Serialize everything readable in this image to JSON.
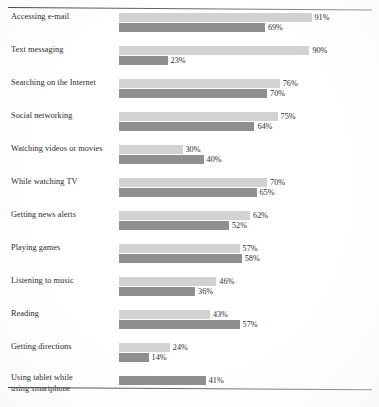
{
  "figure": {
    "top_rule": "horizontal-rule",
    "bottom_rule": "horizontal-rule",
    "footnote": ""
  },
  "chart_data": {
    "type": "bar",
    "orientation": "horizontal",
    "grouped": true,
    "title": "",
    "subtitle": "",
    "xlabel": "",
    "ylabel": "",
    "xlim": [
      0,
      100
    ],
    "grid": false,
    "legend_position": "none",
    "value_suffix": "%",
    "colors": {
      "series_1": "#d2d2d2",
      "series_2": "#8f8f8f",
      "text": "#2b2b2b",
      "rule": "#4a4a4a",
      "background": "#ffffff"
    },
    "categories": [
      "Accessing e-mail",
      "Text messaging",
      "Searching on the Internet",
      "Social networking",
      "Watching videos or movies",
      "While watching TV",
      "Getting news alerts",
      "Playing games",
      "Listening to music",
      "Reading",
      "Getting directions",
      "Using tablet while using smartphone"
    ],
    "series": [
      {
        "name": "series_1",
        "values": [
          91,
          90,
          76,
          75,
          30,
          70,
          62,
          57,
          46,
          43,
          24,
          null
        ]
      },
      {
        "name": "series_2",
        "values": [
          69,
          23,
          70,
          64,
          40,
          65,
          52,
          58,
          36,
          57,
          14,
          41
        ]
      }
    ],
    "rows": [
      {
        "label": "Accessing e-mail",
        "label_lines": [
          "Accessing e-mail"
        ],
        "bars": [
          {
            "value": 91,
            "value_label": "91%",
            "tone": "light"
          },
          {
            "value": 69,
            "value_label": "69%",
            "tone": "dark"
          }
        ]
      },
      {
        "label": "Text messaging",
        "label_lines": [
          "Text messaging"
        ],
        "bars": [
          {
            "value": 90,
            "value_label": "90%",
            "tone": "light"
          },
          {
            "value": 23,
            "value_label": "23%",
            "tone": "dark"
          }
        ]
      },
      {
        "label": "Searching on the Internet",
        "label_lines": [
          "Searching on the Internet"
        ],
        "bars": [
          {
            "value": 76,
            "value_label": "76%",
            "tone": "light"
          },
          {
            "value": 70,
            "value_label": "70%",
            "tone": "dark"
          }
        ]
      },
      {
        "label": "Social networking",
        "label_lines": [
          "Social networking"
        ],
        "bars": [
          {
            "value": 75,
            "value_label": "75%",
            "tone": "light"
          },
          {
            "value": 64,
            "value_label": "64%",
            "tone": "dark"
          }
        ]
      },
      {
        "label": "Watching videos or movies",
        "label_lines": [
          "Watching videos or movies"
        ],
        "bars": [
          {
            "value": 30,
            "value_label": "30%",
            "tone": "light"
          },
          {
            "value": 40,
            "value_label": "40%",
            "tone": "dark"
          }
        ]
      },
      {
        "label": "While watching TV",
        "label_lines": [
          "While watching TV"
        ],
        "bars": [
          {
            "value": 70,
            "value_label": "70%",
            "tone": "light"
          },
          {
            "value": 65,
            "value_label": "65%",
            "tone": "dark"
          }
        ]
      },
      {
        "label": "Getting news alerts",
        "label_lines": [
          "Getting news alerts"
        ],
        "bars": [
          {
            "value": 62,
            "value_label": "62%",
            "tone": "light"
          },
          {
            "value": 52,
            "value_label": "52%",
            "tone": "dark"
          }
        ]
      },
      {
        "label": "Playing games",
        "label_lines": [
          "Playing games"
        ],
        "bars": [
          {
            "value": 57,
            "value_label": "57%",
            "tone": "light"
          },
          {
            "value": 58,
            "value_label": "58%",
            "tone": "dark"
          }
        ]
      },
      {
        "label": "Listening to music",
        "label_lines": [
          "Listening to music"
        ],
        "bars": [
          {
            "value": 46,
            "value_label": "46%",
            "tone": "light"
          },
          {
            "value": 36,
            "value_label": "36%",
            "tone": "dark"
          }
        ]
      },
      {
        "label": "Reading",
        "label_lines": [
          "Reading"
        ],
        "bars": [
          {
            "value": 43,
            "value_label": "43%",
            "tone": "light"
          },
          {
            "value": 57,
            "value_label": "57%",
            "tone": "dark"
          }
        ]
      },
      {
        "label": "Getting directions",
        "label_lines": [
          "Getting directions"
        ],
        "bars": [
          {
            "value": 24,
            "value_label": "24%",
            "tone": "light"
          },
          {
            "value": 14,
            "value_label": "14%",
            "tone": "dark"
          }
        ]
      },
      {
        "label": "Using tablet while using smartphone",
        "label_lines": [
          "Using tablet while",
          "using smartphone"
        ],
        "bars": [
          {
            "value": 41,
            "value_label": "41%",
            "tone": "dark"
          }
        ]
      }
    ]
  }
}
